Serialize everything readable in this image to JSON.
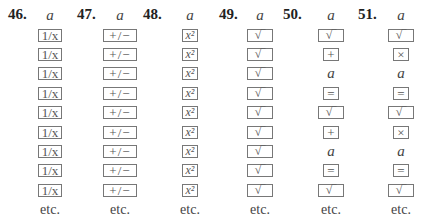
{
  "problems": [
    {
      "number": "46.",
      "items": [
        {
          "type": "var",
          "text": "a"
        },
        {
          "type": "key",
          "text": "1/x",
          "icon": "reciprocal-key"
        },
        {
          "type": "key",
          "text": "1/x",
          "icon": "reciprocal-key"
        },
        {
          "type": "key",
          "text": "1/x",
          "icon": "reciprocal-key"
        },
        {
          "type": "key",
          "text": "1/x",
          "icon": "reciprocal-key"
        },
        {
          "type": "key",
          "text": "1/x",
          "icon": "reciprocal-key"
        },
        {
          "type": "key",
          "text": "1/x",
          "icon": "reciprocal-key"
        },
        {
          "type": "key",
          "text": "1/x",
          "icon": "reciprocal-key"
        },
        {
          "type": "key",
          "text": "1/x",
          "icon": "reciprocal-key"
        },
        {
          "type": "key",
          "text": "1/x",
          "icon": "reciprocal-key"
        }
      ],
      "etc": "etc."
    },
    {
      "number": "47.",
      "items": [
        {
          "type": "var",
          "text": "a"
        },
        {
          "type": "key",
          "text": "+/−",
          "icon": "change-sign-key"
        },
        {
          "type": "key",
          "text": "+/−",
          "icon": "change-sign-key"
        },
        {
          "type": "key",
          "text": "+/−",
          "icon": "change-sign-key"
        },
        {
          "type": "key",
          "text": "+/−",
          "icon": "change-sign-key"
        },
        {
          "type": "key",
          "text": "+/−",
          "icon": "change-sign-key"
        },
        {
          "type": "key",
          "text": "+/−",
          "icon": "change-sign-key"
        },
        {
          "type": "key",
          "text": "+/−",
          "icon": "change-sign-key"
        },
        {
          "type": "key",
          "text": "+/−",
          "icon": "change-sign-key"
        },
        {
          "type": "key",
          "text": "+/−",
          "icon": "change-sign-key"
        }
      ],
      "etc": "etc."
    },
    {
      "number": "48.",
      "items": [
        {
          "type": "var",
          "text": "a"
        },
        {
          "type": "key",
          "text": "x²",
          "icon": "square-key"
        },
        {
          "type": "key",
          "text": "x²",
          "icon": "square-key"
        },
        {
          "type": "key",
          "text": "x²",
          "icon": "square-key"
        },
        {
          "type": "key",
          "text": "x²",
          "icon": "square-key"
        },
        {
          "type": "key",
          "text": "x²",
          "icon": "square-key"
        },
        {
          "type": "key",
          "text": "x²",
          "icon": "square-key"
        },
        {
          "type": "key",
          "text": "x²",
          "icon": "square-key"
        },
        {
          "type": "key",
          "text": "x²",
          "icon": "square-key"
        },
        {
          "type": "key",
          "text": "x²",
          "icon": "square-key"
        }
      ],
      "etc": "etc."
    },
    {
      "number": "49.",
      "items": [
        {
          "type": "var",
          "text": "a"
        },
        {
          "type": "key",
          "text": "√‾",
          "icon": "square-root-key"
        },
        {
          "type": "key",
          "text": "√‾",
          "icon": "square-root-key"
        },
        {
          "type": "key",
          "text": "√‾",
          "icon": "square-root-key"
        },
        {
          "type": "key",
          "text": "√‾",
          "icon": "square-root-key"
        },
        {
          "type": "key",
          "text": "√‾",
          "icon": "square-root-key"
        },
        {
          "type": "key",
          "text": "√‾",
          "icon": "square-root-key"
        },
        {
          "type": "key",
          "text": "√‾",
          "icon": "square-root-key"
        },
        {
          "type": "key",
          "text": "√‾",
          "icon": "square-root-key"
        },
        {
          "type": "key",
          "text": "√‾",
          "icon": "square-root-key"
        }
      ],
      "etc": "etc."
    },
    {
      "number": "50.",
      "items": [
        {
          "type": "var",
          "text": "a"
        },
        {
          "type": "key",
          "text": "√‾",
          "icon": "square-root-key"
        },
        {
          "type": "key",
          "text": "+",
          "icon": "plus-key"
        },
        {
          "type": "var",
          "text": "a"
        },
        {
          "type": "key",
          "text": "=",
          "icon": "equals-key"
        },
        {
          "type": "key",
          "text": "√‾",
          "icon": "square-root-key"
        },
        {
          "type": "key",
          "text": "+",
          "icon": "plus-key"
        },
        {
          "type": "var",
          "text": "a"
        },
        {
          "type": "key",
          "text": "=",
          "icon": "equals-key"
        },
        {
          "type": "key",
          "text": "√‾",
          "icon": "square-root-key"
        }
      ],
      "etc": "etc."
    },
    {
      "number": "51.",
      "items": [
        {
          "type": "var",
          "text": "a"
        },
        {
          "type": "key",
          "text": "√‾",
          "icon": "square-root-key"
        },
        {
          "type": "key",
          "text": "×",
          "icon": "multiply-key"
        },
        {
          "type": "var",
          "text": "a"
        },
        {
          "type": "key",
          "text": "=",
          "icon": "equals-key"
        },
        {
          "type": "key",
          "text": "√‾",
          "icon": "square-root-key"
        },
        {
          "type": "key",
          "text": "×",
          "icon": "multiply-key"
        },
        {
          "type": "var",
          "text": "a"
        },
        {
          "type": "key",
          "text": "=",
          "icon": "equals-key"
        },
        {
          "type": "key",
          "text": "√‾",
          "icon": "square-root-key"
        }
      ],
      "etc": "etc."
    }
  ]
}
